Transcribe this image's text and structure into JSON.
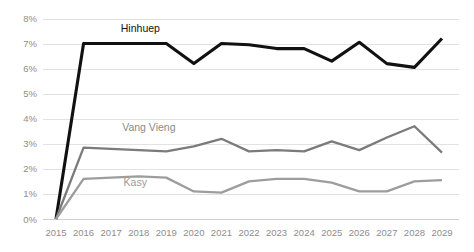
{
  "chart_data": {
    "type": "line",
    "title": "",
    "xlabel": "",
    "ylabel": "",
    "categories": [
      "2015",
      "2016",
      "2017",
      "2018",
      "2019",
      "2020",
      "2021",
      "2022",
      "2023",
      "2024",
      "2025",
      "2026",
      "2027",
      "2028",
      "2029"
    ],
    "x": [
      2015,
      2016,
      2017,
      2018,
      2019,
      2020,
      2021,
      2022,
      2023,
      2024,
      2025,
      2026,
      2027,
      2028,
      2029
    ],
    "ylim": [
      0,
      8
    ],
    "y_ticks": [
      0,
      1,
      2,
      3,
      4,
      5,
      6,
      7,
      8
    ],
    "y_tick_labels": [
      "0%",
      "1%",
      "2%",
      "3%",
      "4%",
      "5%",
      "6%",
      "7%",
      "8%"
    ],
    "y_unit": "%",
    "grid": true,
    "legend": "inline-labels",
    "series": [
      {
        "name": "Hinhuep",
        "color": "#111111",
        "width": 3.1,
        "label_x": 2017.35,
        "label_y": 7.45,
        "label_color": "#111111",
        "values": [
          0,
          7.0,
          7.0,
          7.0,
          7.0,
          6.2,
          7.0,
          6.95,
          6.8,
          6.8,
          6.3,
          7.05,
          6.2,
          6.05,
          7.2
        ]
      },
      {
        "name": "Vang Vieng",
        "color": "#7b7b7b",
        "width": 2.3,
        "label_x": 2017.4,
        "label_y": 3.5,
        "label_color": "#8a8a8a",
        "values": [
          0,
          2.85,
          2.8,
          2.75,
          2.7,
          2.9,
          3.2,
          2.7,
          2.75,
          2.7,
          3.1,
          2.75,
          3.25,
          3.7,
          2.65
        ]
      },
      {
        "name": "Kasy",
        "color": "#9d9d9d",
        "width": 2.3,
        "label_x": 2017.45,
        "label_y": 1.32,
        "label_color": "#9a9a9a",
        "values": [
          0,
          1.6,
          1.65,
          1.7,
          1.65,
          1.1,
          1.05,
          1.5,
          1.6,
          1.6,
          1.45,
          1.1,
          1.1,
          1.5,
          1.55
        ]
      }
    ],
    "colors": {
      "gridline": "#e2e2e2",
      "axis_text": "#8d8d8d",
      "background": "#ffffff"
    }
  }
}
